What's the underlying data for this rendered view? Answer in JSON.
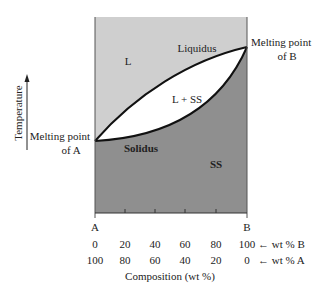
{
  "diagram": {
    "type": "binary isomorphous phase diagram",
    "colors": {
      "liquid_region": "#cfcfcf",
      "solid_region": "#8f8f8f",
      "two_phase_region": "#ffffff",
      "lines": "#111111"
    },
    "y_axis_label": "Temperature",
    "regions": {
      "liquid": "L",
      "two_phase": "L + SS",
      "solid": "SS"
    },
    "curves": {
      "liquidus": "Liquidus",
      "solidus": "Solidus"
    },
    "annotations": {
      "melting_a_line1": "Melting point",
      "melting_a_line2": "of A",
      "melting_b_line1": "Melting point",
      "melting_b_line2": "of B"
    },
    "x_axis": {
      "end_left": "A",
      "end_right": "B",
      "wt_b": [
        "0",
        "20",
        "40",
        "60",
        "80",
        "100"
      ],
      "wt_b_suffix": "← wt % B",
      "wt_a": [
        "100",
        "80",
        "60",
        "40",
        "20",
        "0"
      ],
      "wt_a_suffix": "← wt % A",
      "title": "Composition (wt %)"
    }
  }
}
